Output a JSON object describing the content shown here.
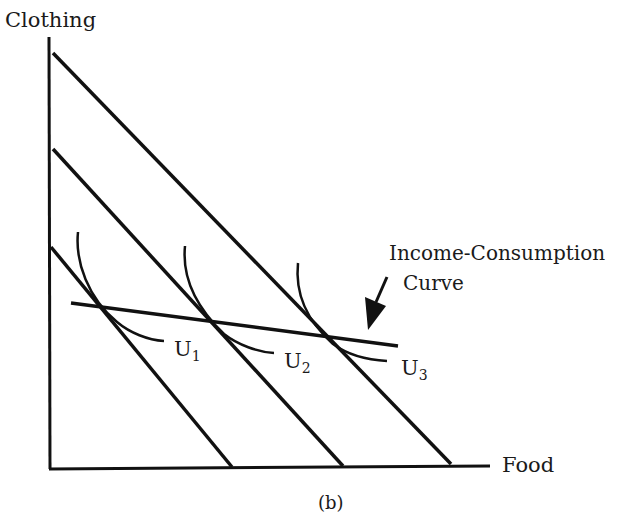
{
  "figure": {
    "caption": "(b)",
    "y_axis_label": "Clothing",
    "x_axis_label": "Food",
    "annotation": {
      "line1": "Income-Consumption",
      "line2": "Curve"
    },
    "indifference_curves": [
      {
        "letter": "U",
        "sub": "1"
      },
      {
        "letter": "U",
        "sub": "2"
      },
      {
        "letter": "U",
        "sub": "3"
      }
    ],
    "colors": {
      "ink": "#111111",
      "background": "#ffffff"
    }
  }
}
